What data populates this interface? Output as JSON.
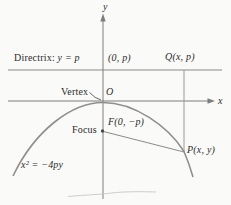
{
  "figure": {
    "labels": {
      "y_axis": "y",
      "x_axis": "x",
      "directrix_prefix": "Directrix: ",
      "directrix_value": "y = p",
      "origin_point": "(0, p)",
      "q_point": "Q(x, p)",
      "vertex": "Vertex",
      "origin": "O",
      "focus": "Focus",
      "focus_point": "F(0, −p)",
      "p_point": "P(x, y)",
      "equation": "x² = −4py"
    },
    "colors": {
      "background": "#fafaf8",
      "line": "#8a8a8a",
      "curve": "#8f8f8f",
      "text": "#2b2b2b"
    }
  }
}
